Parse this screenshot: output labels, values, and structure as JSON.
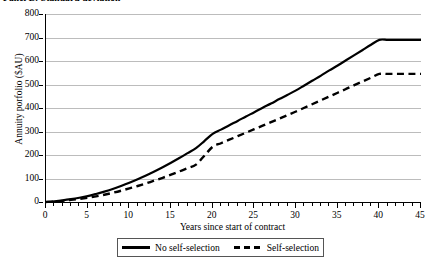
{
  "panel": {
    "title": "Panel B: Standard deviation"
  },
  "chart_data": {
    "type": "line",
    "title": "Panel B: Standard deviation",
    "xlabel": "Years since start of contract",
    "ylabel": "Annuity porfolio ($AU)",
    "xlim": [
      0,
      45
    ],
    "ylim": [
      0,
      800
    ],
    "grid": "horizontal",
    "legend_position": "bottom",
    "x_ticks": [
      0,
      5,
      10,
      15,
      20,
      25,
      30,
      35,
      40,
      45
    ],
    "x_minor_tick_interval": 1,
    "y_ticks": [
      0,
      100,
      200,
      300,
      400,
      500,
      600,
      700,
      800
    ],
    "x": [
      0,
      1,
      2,
      3,
      4,
      5,
      6,
      7,
      8,
      9,
      10,
      11,
      12,
      13,
      14,
      15,
      16,
      17,
      18,
      19,
      20,
      21,
      22,
      23,
      24,
      25,
      26,
      27,
      28,
      29,
      30,
      31,
      32,
      33,
      34,
      35,
      36,
      37,
      38,
      39,
      40,
      41,
      42,
      43,
      44,
      45
    ],
    "series": [
      {
        "name": "No self-selection",
        "style": "solid",
        "color": "#000000",
        "values": [
          0,
          3,
          7,
          12,
          18,
          25,
          34,
          44,
          55,
          68,
          82,
          97,
          113,
          130,
          148,
          167,
          187,
          208,
          229,
          259,
          290,
          308,
          327,
          345,
          364,
          382,
          401,
          419,
          438,
          456,
          475,
          496,
          517,
          538,
          560,
          581,
          603,
          625,
          647,
          669,
          690,
          690,
          690,
          690,
          690,
          690
        ]
      },
      {
        "name": "Self-selection",
        "style": "dashed",
        "color": "#000000",
        "values": [
          0,
          2,
          5,
          9,
          13,
          18,
          24,
          31,
          39,
          48,
          58,
          68,
          79,
          91,
          103,
          116,
          130,
          144,
          159,
          197,
          235,
          250,
          265,
          280,
          295,
          310,
          325,
          340,
          355,
          370,
          385,
          401,
          417,
          433,
          449,
          465,
          481,
          497,
          513,
          529,
          545,
          545,
          545,
          545,
          545,
          545
        ]
      }
    ]
  },
  "legend": {
    "entries": [
      {
        "label": "No self-selection",
        "style": "solid"
      },
      {
        "label": "Self-selection",
        "style": "dashed"
      }
    ]
  }
}
